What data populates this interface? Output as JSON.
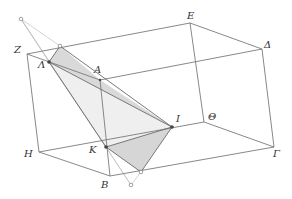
{
  "diagram": {
    "type": "geometry-3d-parallelepiped-section",
    "colors": {
      "edge": "#707070",
      "construction": "#b8b8b8",
      "fill_light": "#ebebeb",
      "fill_dark": "#d6d6d6",
      "point": "#444444",
      "label": "#333333"
    },
    "vertices": {
      "Z": {
        "label": "Z",
        "x": 27,
        "y": 54,
        "lx": 14,
        "ly": 53
      },
      "E": {
        "label": "E",
        "x": 190,
        "y": 23,
        "lx": 187,
        "ly": 19
      },
      "Delta": {
        "label": "Δ",
        "x": 262,
        "y": 49,
        "lx": 264,
        "ly": 48
      },
      "H": {
        "label": "H",
        "x": 39,
        "y": 152,
        "lx": 24,
        "ly": 157
      },
      "Theta": {
        "label": "Θ",
        "x": 204,
        "y": 122,
        "lx": 208,
        "ly": 120
      },
      "Gamma": {
        "label": "Γ",
        "x": 274,
        "y": 147,
        "lx": 273,
        "ly": 157
      },
      "B": {
        "label": "B",
        "x": 110,
        "y": 176,
        "lx": 101,
        "ly": 188
      },
      "A_back": {
        "label": "",
        "x": 100,
        "y": 80
      }
    },
    "points": {
      "Lambda": {
        "label": "Λ",
        "x": 49,
        "y": 62,
        "lx": 38,
        "ly": 68
      },
      "A": {
        "label": "A",
        "x": 100,
        "y": 80,
        "lx": 94,
        "ly": 73
      },
      "I": {
        "label": "I",
        "x": 172,
        "y": 127,
        "lx": 176,
        "ly": 122
      },
      "K": {
        "label": "K",
        "x": 106,
        "y": 147,
        "lx": 89,
        "ly": 153
      }
    },
    "aux_points": [
      {
        "name": "apex",
        "x": 21,
        "y": 19
      },
      {
        "name": "top-edge-point",
        "x": 60,
        "y": 46
      },
      {
        "name": "bottom-edge-point",
        "x": 141,
        "y": 172
      },
      {
        "name": "bottom-apex",
        "x": 131,
        "y": 185
      }
    ]
  }
}
